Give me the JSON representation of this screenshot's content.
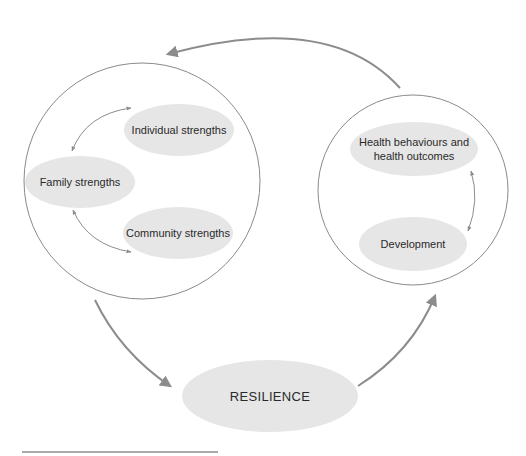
{
  "diagram": {
    "type": "cycle-flow",
    "left_group": {
      "nodes": [
        {
          "id": "individual",
          "label": "Individual strengths"
        },
        {
          "id": "family",
          "label": "Family strengths"
        },
        {
          "id": "community",
          "label": "Community strengths"
        }
      ]
    },
    "right_group": {
      "nodes": [
        {
          "id": "health",
          "label_line1": "Health behaviours and",
          "label_line2": "health outcomes"
        },
        {
          "id": "development",
          "label": "Development"
        }
      ]
    },
    "center_node": {
      "id": "resilience",
      "label": "RESILIENCE"
    },
    "edges": [
      {
        "from": "left_group",
        "to": "resilience",
        "style": "thick-arrow"
      },
      {
        "from": "resilience",
        "to": "right_group",
        "style": "thick-arrow"
      },
      {
        "from": "right_group",
        "to": "left_group",
        "style": "thick-arrow"
      },
      {
        "from": "family",
        "to": "individual",
        "style": "thin-double-arrow"
      },
      {
        "from": "family",
        "to": "community",
        "style": "thin-double-arrow"
      },
      {
        "from": "health",
        "to": "development",
        "style": "thin-double-arrow"
      }
    ],
    "colors": {
      "node_fill": "#e6e6e6",
      "arrow": "#8c8c8c",
      "ring": "#8a8a8a",
      "text": "#2a2a2a"
    }
  }
}
